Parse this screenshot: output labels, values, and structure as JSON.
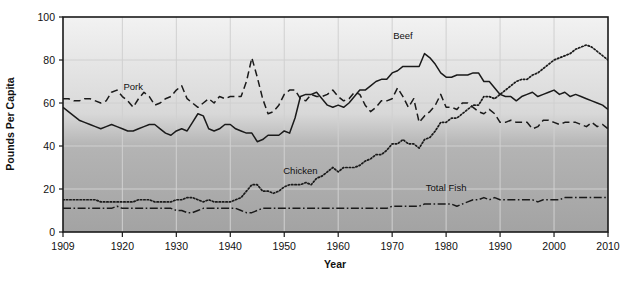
{
  "chart_data": {
    "type": "line",
    "title": "",
    "xlabel": "Year",
    "ylabel": "Pounds Per Capita",
    "xlim": [
      1909,
      2010
    ],
    "ylim": [
      0,
      100
    ],
    "grid": true,
    "legend": "inline-annotations",
    "xticks": [
      "1909",
      "1920",
      "1930",
      "1940",
      "1950",
      "1960",
      "1970",
      "1980",
      "1990",
      "2000",
      "2010"
    ],
    "xtick_values": [
      1909,
      1920,
      1930,
      1940,
      1950,
      1960,
      1970,
      1980,
      1990,
      2000,
      2010
    ],
    "yticks": [
      "0",
      "20",
      "40",
      "60",
      "80",
      "100"
    ],
    "ytick_values": [
      0,
      20,
      40,
      60,
      80,
      100
    ],
    "series": [
      {
        "name": "Beef",
        "style": "solid",
        "color": "#1a1a1a",
        "label_x": 1972,
        "label_y": 90,
        "x": [
          1909,
          1910,
          1911,
          1912,
          1913,
          1914,
          1915,
          1916,
          1917,
          1918,
          1919,
          1920,
          1921,
          1922,
          1923,
          1924,
          1925,
          1926,
          1927,
          1928,
          1929,
          1930,
          1931,
          1932,
          1933,
          1934,
          1935,
          1936,
          1937,
          1938,
          1939,
          1940,
          1941,
          1942,
          1943,
          1944,
          1945,
          1946,
          1947,
          1948,
          1949,
          1950,
          1951,
          1952,
          1953,
          1954,
          1955,
          1956,
          1957,
          1958,
          1959,
          1960,
          1961,
          1962,
          1963,
          1964,
          1965,
          1966,
          1967,
          1968,
          1969,
          1970,
          1971,
          1972,
          1973,
          1974,
          1975,
          1976,
          1977,
          1978,
          1979,
          1980,
          1981,
          1982,
          1983,
          1984,
          1985,
          1986,
          1987,
          1988,
          1989,
          1990,
          1991,
          1992,
          1993,
          1994,
          1995,
          1996,
          1997,
          1998,
          1999,
          2000,
          2001,
          2002,
          2003,
          2004,
          2005,
          2006,
          2007,
          2008,
          2009,
          2010
        ],
        "y": [
          58,
          56,
          54,
          52,
          51,
          50,
          49,
          48,
          49,
          50,
          49,
          48,
          47,
          47,
          48,
          49,
          50,
          50,
          48,
          46,
          45,
          47,
          48,
          47,
          51,
          55,
          54,
          48,
          47,
          48,
          50,
          50,
          48,
          47,
          46,
          46,
          42,
          43,
          45,
          45,
          45,
          47,
          46,
          53,
          63,
          64,
          64,
          65,
          62,
          59,
          58,
          59,
          58,
          60,
          63,
          66,
          66,
          68,
          70,
          71,
          71,
          74,
          75,
          77,
          77,
          77,
          77,
          83,
          81,
          78,
          74,
          72,
          72,
          73,
          73,
          73,
          74,
          74,
          70,
          70,
          67,
          64,
          63,
          63,
          61,
          63,
          64,
          65,
          63,
          64,
          65,
          66,
          64,
          65,
          63,
          64,
          63,
          62,
          61,
          60,
          59,
          57
        ]
      },
      {
        "name": "Pork",
        "style": "dashed",
        "color": "#1a1a1a",
        "label_x": 1922,
        "label_y": 66,
        "x": [
          1909,
          1910,
          1911,
          1912,
          1913,
          1914,
          1915,
          1916,
          1917,
          1918,
          1919,
          1920,
          1921,
          1922,
          1923,
          1924,
          1925,
          1926,
          1927,
          1928,
          1929,
          1930,
          1931,
          1932,
          1933,
          1934,
          1935,
          1936,
          1937,
          1938,
          1939,
          1940,
          1941,
          1942,
          1943,
          1944,
          1945,
          1946,
          1947,
          1948,
          1949,
          1950,
          1951,
          1952,
          1953,
          1954,
          1955,
          1956,
          1957,
          1958,
          1959,
          1960,
          1961,
          1962,
          1963,
          1964,
          1965,
          1966,
          1967,
          1968,
          1969,
          1970,
          1971,
          1972,
          1973,
          1974,
          1975,
          1976,
          1977,
          1978,
          1979,
          1980,
          1981,
          1982,
          1983,
          1984,
          1985,
          1986,
          1987,
          1988,
          1989,
          1990,
          1991,
          1992,
          1993,
          1994,
          1995,
          1996,
          1997,
          1998,
          1999,
          2000,
          2001,
          2002,
          2003,
          2004,
          2005,
          2006,
          2007,
          2008,
          2009,
          2010
        ],
        "y": [
          62,
          62,
          61,
          61,
          62,
          62,
          61,
          60,
          61,
          65,
          66,
          63,
          61,
          58,
          62,
          65,
          63,
          59,
          60,
          62,
          63,
          66,
          68,
          62,
          60,
          58,
          60,
          62,
          60,
          63,
          62,
          63,
          63,
          63,
          70,
          81,
          72,
          62,
          55,
          56,
          59,
          64,
          66,
          66,
          62,
          61,
          64,
          63,
          63,
          64,
          66,
          63,
          61,
          62,
          65,
          64,
          59,
          56,
          58,
          61,
          61,
          62,
          67,
          63,
          58,
          62,
          51,
          54,
          56,
          59,
          64,
          58,
          58,
          57,
          60,
          60,
          58,
          56,
          55,
          57,
          55,
          51,
          51,
          52,
          51,
          51,
          51,
          48,
          49,
          52,
          52,
          51,
          50,
          51,
          51,
          51,
          50,
          49,
          51,
          49,
          50,
          48
        ]
      },
      {
        "name": "Chicken",
        "style": "dotted",
        "color": "#1a1a1a",
        "label_x": 1953,
        "label_y": 27,
        "x": [
          1909,
          1910,
          1911,
          1912,
          1913,
          1914,
          1915,
          1916,
          1917,
          1918,
          1919,
          1920,
          1921,
          1922,
          1923,
          1924,
          1925,
          1926,
          1927,
          1928,
          1929,
          1930,
          1931,
          1932,
          1933,
          1934,
          1935,
          1936,
          1937,
          1938,
          1939,
          1940,
          1941,
          1942,
          1943,
          1944,
          1945,
          1946,
          1947,
          1948,
          1949,
          1950,
          1951,
          1952,
          1953,
          1954,
          1955,
          1956,
          1957,
          1958,
          1959,
          1960,
          1961,
          1962,
          1963,
          1964,
          1965,
          1966,
          1967,
          1968,
          1969,
          1970,
          1971,
          1972,
          1973,
          1974,
          1975,
          1976,
          1977,
          1978,
          1979,
          1980,
          1981,
          1982,
          1983,
          1984,
          1985,
          1986,
          1987,
          1988,
          1989,
          1990,
          1991,
          1992,
          1993,
          1994,
          1995,
          1996,
          1997,
          1998,
          1999,
          2000,
          2001,
          2002,
          2003,
          2004,
          2005,
          2006,
          2007,
          2008,
          2009,
          2010
        ],
        "y": [
          15,
          15,
          15,
          15,
          15,
          15,
          15,
          14,
          14,
          14,
          14,
          14,
          14,
          14,
          15,
          15,
          15,
          14,
          14,
          14,
          14,
          15,
          15,
          16,
          16,
          15,
          14,
          15,
          14,
          14,
          14,
          14,
          15,
          16,
          19,
          22,
          22,
          19,
          19,
          18,
          19,
          21,
          22,
          22,
          22,
          23,
          22,
          25,
          26,
          28,
          30,
          28,
          30,
          30,
          30,
          31,
          33,
          34,
          36,
          36,
          38,
          41,
          41,
          43,
          41,
          41,
          39,
          43,
          44,
          47,
          51,
          51,
          53,
          53,
          55,
          57,
          59,
          59,
          63,
          63,
          62,
          64,
          66,
          68,
          70,
          71,
          71,
          73,
          74,
          76,
          78,
          80,
          81,
          82,
          83,
          85,
          86,
          87,
          86,
          84,
          82,
          80
        ]
      },
      {
        "name": "Total Fish",
        "style": "dash-dot",
        "color": "#1a1a1a",
        "label_x": 1980,
        "label_y": 19,
        "x": [
          1909,
          1910,
          1911,
          1912,
          1913,
          1914,
          1915,
          1916,
          1917,
          1918,
          1919,
          1920,
          1921,
          1922,
          1923,
          1924,
          1925,
          1926,
          1927,
          1928,
          1929,
          1930,
          1931,
          1932,
          1933,
          1934,
          1935,
          1936,
          1937,
          1938,
          1939,
          1940,
          1941,
          1942,
          1943,
          1944,
          1945,
          1946,
          1947,
          1948,
          1949,
          1950,
          1951,
          1952,
          1953,
          1954,
          1955,
          1956,
          1957,
          1958,
          1959,
          1960,
          1961,
          1962,
          1963,
          1964,
          1965,
          1966,
          1967,
          1968,
          1969,
          1970,
          1971,
          1972,
          1973,
          1974,
          1975,
          1976,
          1977,
          1978,
          1979,
          1980,
          1981,
          1982,
          1983,
          1984,
          1985,
          1986,
          1987,
          1988,
          1989,
          1990,
          1991,
          1992,
          1993,
          1994,
          1995,
          1996,
          1997,
          1998,
          1999,
          2000,
          2001,
          2002,
          2003,
          2004,
          2005,
          2006,
          2007,
          2008,
          2009,
          2010
        ],
        "y": [
          11,
          11,
          11,
          11,
          11,
          11,
          11,
          11,
          11,
          11,
          12,
          11,
          11,
          11,
          11,
          11,
          11,
          11,
          11,
          11,
          11,
          10,
          10,
          9,
          9,
          10,
          11,
          11,
          11,
          11,
          11,
          11,
          11,
          10,
          9,
          9,
          10,
          11,
          11,
          11,
          11,
          11,
          11,
          11,
          11,
          11,
          11,
          11,
          11,
          11,
          11,
          11,
          11,
          11,
          11,
          11,
          11,
          11,
          11,
          11,
          11,
          12,
          12,
          12,
          12,
          12,
          12,
          13,
          13,
          13,
          13,
          13,
          13,
          12,
          13,
          14,
          15,
          15,
          16,
          15,
          16,
          15,
          15,
          15,
          15,
          15,
          15,
          15,
          14,
          15,
          15,
          15,
          15,
          16,
          16,
          16,
          16,
          16,
          16,
          16,
          16,
          16
        ]
      }
    ]
  },
  "style": {
    "plot_bg_top": "#efefef",
    "plot_bg_bottom": "#9d9d9d",
    "grid_color": "#d0d0d0",
    "axis_color": "#1a1a1a",
    "line_color": "#1a1a1a"
  }
}
